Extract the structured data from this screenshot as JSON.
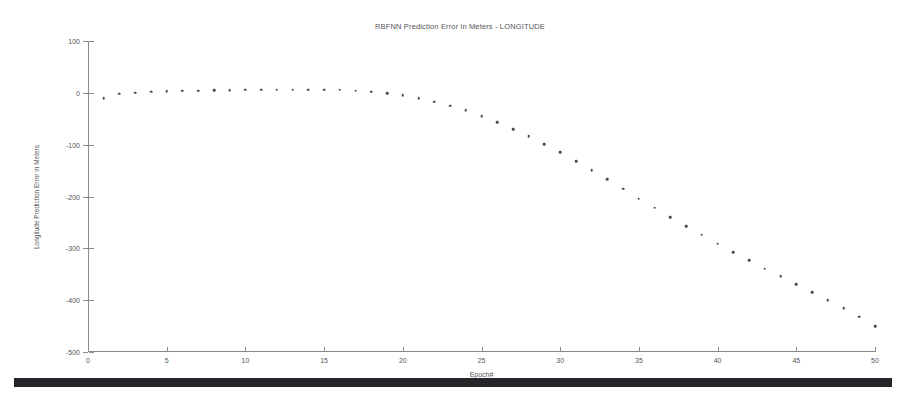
{
  "chart_data": {
    "type": "scatter",
    "title": "RBFNN Prediction Error in Meters - LONGITUDE",
    "xlabel": "Epoch#",
    "ylabel": "Longitude Prediction Error in Meters",
    "xlim": [
      0,
      50
    ],
    "ylim": [
      -500,
      100
    ],
    "xticks": [
      0,
      5,
      10,
      15,
      20,
      25,
      30,
      35,
      40,
      45,
      50
    ],
    "yticks": [
      100,
      0,
      -100,
      -200,
      -300,
      -400,
      -500
    ],
    "grid": false,
    "legend": null,
    "marker_color": "#4a4a52",
    "x": [
      1,
      2,
      3,
      4,
      5,
      6,
      7,
      8,
      9,
      10,
      11,
      12,
      13,
      14,
      15,
      16,
      17,
      18,
      19,
      20,
      21,
      22,
      23,
      24,
      25,
      26,
      27,
      28,
      29,
      30,
      31,
      32,
      33,
      34,
      35,
      36,
      37,
      38,
      39,
      40,
      41,
      42,
      43,
      44,
      45,
      46,
      47,
      48,
      49,
      50
    ],
    "values": [
      -10,
      -2,
      0,
      2,
      3,
      4,
      4,
      5,
      5,
      6,
      6,
      6,
      6,
      6,
      6,
      6,
      4,
      2,
      -1,
      -5,
      -10,
      -17,
      -25,
      -34,
      -45,
      -57,
      -70,
      -84,
      -99,
      -115,
      -132,
      -149,
      -167,
      -185,
      -204,
      -222,
      -240,
      -257,
      -274,
      -291,
      -307,
      -323,
      -339,
      -354,
      -369,
      -385,
      -400,
      -416,
      -432,
      -450
    ]
  },
  "artifacts": {
    "scan_bar": "dark-scan-edge"
  }
}
